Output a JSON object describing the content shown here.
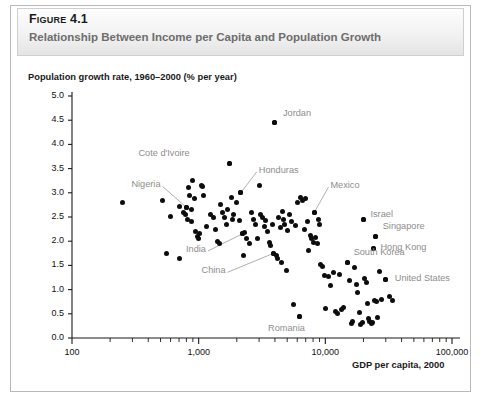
{
  "figure": {
    "number_label": "Figure 4.1",
    "subtitle": "Relationship Between Income per Capita and Population Growth",
    "accent_color": "#4c4c4c",
    "label_color": "#8d8d8d",
    "point_color": "#0d0d0d"
  },
  "chart_data": {
    "type": "scatter",
    "title": "Relationship Between Income per Capita and Population Growth",
    "xlabel": "GDP per capita, 2000",
    "ylabel": "Population growth rate, 1960–2000 (% per year)",
    "x_scale": "log",
    "y_scale": "linear",
    "xlim": [
      100,
      100000
    ],
    "ylim": [
      0.0,
      5.0
    ],
    "grid": false,
    "legend": null,
    "x_tick_labels": [
      "100",
      "1,000",
      "10,000",
      "100,000"
    ],
    "x_tick_values": [
      100,
      1000,
      10000,
      100000
    ],
    "y_tick_labels": [
      "0.0",
      "0.5",
      "1.0",
      "1.5",
      "2.0",
      "2.5",
      "3.0",
      "3.5",
      "4.0",
      "4.5",
      "5.0"
    ],
    "y_tick_values": [
      0.0,
      0.5,
      1.0,
      1.5,
      2.0,
      2.5,
      3.0,
      3.5,
      4.0,
      4.5,
      5.0
    ],
    "minor_ticks": "log decades 2-9",
    "annotations": [
      {
        "label": "Jordan",
        "x": 4000,
        "y": 4.45,
        "label_dx": 8,
        "label_dy": -9,
        "leader": false
      },
      {
        "label": "Cote d'Ivoire",
        "x": 1750,
        "y": 3.6,
        "label_dx": -52,
        "label_dy": -10,
        "leader": false
      },
      {
        "label": "Honduras",
        "x": 2150,
        "y": 3.0,
        "label_dx": 18,
        "label_dy": -22,
        "leader": true
      },
      {
        "label": "Nigeria",
        "x": 800,
        "y": 2.7,
        "label_dx": -38,
        "label_dy": -22,
        "leader": true
      },
      {
        "label": "Mexico",
        "x": 8200,
        "y": 2.6,
        "label_dx": 16,
        "label_dy": -26,
        "leader": true
      },
      {
        "label": "Israel",
        "x": 20000,
        "y": 2.45,
        "label_dx": 7,
        "label_dy": -4,
        "leader": false
      },
      {
        "label": "Singapore",
        "x": 25000,
        "y": 2.1,
        "label_dx": 7,
        "label_dy": -9,
        "leader": false
      },
      {
        "label": "Hong Kong",
        "x": 24000,
        "y": 1.85,
        "label_dx": 7,
        "label_dy": 0,
        "leader": false
      },
      {
        "label": "South Korea",
        "x": 15000,
        "y": 1.55,
        "label_dx": 6,
        "label_dy": -10,
        "leader": false
      },
      {
        "label": "United States",
        "x": 30000,
        "y": 1.2,
        "label_dx": 9,
        "label_dy": -1,
        "leader": false
      },
      {
        "label": "India",
        "x": 2200,
        "y": 2.15,
        "label_dx": -48,
        "label_dy": 16,
        "leader": true
      },
      {
        "label": "China",
        "x": 3900,
        "y": 1.75,
        "label_dx": -60,
        "label_dy": 18,
        "leader": true
      },
      {
        "label": "Romania",
        "x": 6200,
        "y": 0.45,
        "label_dx": -6,
        "label_dy": 13,
        "leader": false
      }
    ],
    "points": [
      {
        "x": 250,
        "y": 2.8
      },
      {
        "x": 520,
        "y": 2.85
      },
      {
        "x": 600,
        "y": 2.52
      },
      {
        "x": 700,
        "y": 2.72
      },
      {
        "x": 760,
        "y": 2.6
      },
      {
        "x": 790,
        "y": 2.55
      },
      {
        "x": 800,
        "y": 2.7
      },
      {
        "x": 810,
        "y": 2.45
      },
      {
        "x": 830,
        "y": 3.1
      },
      {
        "x": 850,
        "y": 2.95
      },
      {
        "x": 870,
        "y": 2.65
      },
      {
        "x": 880,
        "y": 2.4
      },
      {
        "x": 900,
        "y": 3.25
      },
      {
        "x": 920,
        "y": 2.88
      },
      {
        "x": 950,
        "y": 2.2
      },
      {
        "x": 980,
        "y": 2.1
      },
      {
        "x": 1000,
        "y": 2.05
      },
      {
        "x": 1020,
        "y": 2.15
      },
      {
        "x": 1050,
        "y": 3.15
      },
      {
        "x": 1080,
        "y": 3.12
      },
      {
        "x": 1100,
        "y": 2.95
      },
      {
        "x": 1150,
        "y": 2.3
      },
      {
        "x": 560,
        "y": 1.75
      },
      {
        "x": 700,
        "y": 1.65
      },
      {
        "x": 1250,
        "y": 2.55
      },
      {
        "x": 1300,
        "y": 2.48
      },
      {
        "x": 1350,
        "y": 2.25
      },
      {
        "x": 1400,
        "y": 2.0
      },
      {
        "x": 1450,
        "y": 1.95
      },
      {
        "x": 1500,
        "y": 2.75
      },
      {
        "x": 1550,
        "y": 2.6
      },
      {
        "x": 1600,
        "y": 2.5
      },
      {
        "x": 1650,
        "y": 2.35
      },
      {
        "x": 1700,
        "y": 2.65
      },
      {
        "x": 1750,
        "y": 3.6
      },
      {
        "x": 1800,
        "y": 2.9
      },
      {
        "x": 1850,
        "y": 2.45
      },
      {
        "x": 1900,
        "y": 2.55
      },
      {
        "x": 2000,
        "y": 2.8
      },
      {
        "x": 2100,
        "y": 2.42
      },
      {
        "x": 2150,
        "y": 3.0
      },
      {
        "x": 2200,
        "y": 2.15
      },
      {
        "x": 2250,
        "y": 1.7
      },
      {
        "x": 2300,
        "y": 2.18
      },
      {
        "x": 2400,
        "y": 2.05
      },
      {
        "x": 2500,
        "y": 1.95
      },
      {
        "x": 2600,
        "y": 2.6
      },
      {
        "x": 2700,
        "y": 2.45
      },
      {
        "x": 2800,
        "y": 2.35
      },
      {
        "x": 2900,
        "y": 2.05
      },
      {
        "x": 3000,
        "y": 3.15
      },
      {
        "x": 3100,
        "y": 2.55
      },
      {
        "x": 3200,
        "y": 2.48
      },
      {
        "x": 3300,
        "y": 2.3
      },
      {
        "x": 3400,
        "y": 2.42
      },
      {
        "x": 3500,
        "y": 2.2
      },
      {
        "x": 3600,
        "y": 1.98
      },
      {
        "x": 3700,
        "y": 1.92
      },
      {
        "x": 3800,
        "y": 2.35
      },
      {
        "x": 3900,
        "y": 1.75
      },
      {
        "x": 4000,
        "y": 4.45
      },
      {
        "x": 4100,
        "y": 1.7
      },
      {
        "x": 4200,
        "y": 1.65
      },
      {
        "x": 4300,
        "y": 2.5
      },
      {
        "x": 4400,
        "y": 2.28
      },
      {
        "x": 4500,
        "y": 1.55
      },
      {
        "x": 4600,
        "y": 2.62
      },
      {
        "x": 4700,
        "y": 2.45
      },
      {
        "x": 4800,
        "y": 2.35
      },
      {
        "x": 4900,
        "y": 1.4
      },
      {
        "x": 5000,
        "y": 2.22
      },
      {
        "x": 5200,
        "y": 2.55
      },
      {
        "x": 5400,
        "y": 2.4
      },
      {
        "x": 5600,
        "y": 0.7
      },
      {
        "x": 5800,
        "y": 2.32
      },
      {
        "x": 6000,
        "y": 2.8
      },
      {
        "x": 6200,
        "y": 0.45
      },
      {
        "x": 6400,
        "y": 2.9
      },
      {
        "x": 6600,
        "y": 2.85
      },
      {
        "x": 6800,
        "y": 2.25
      },
      {
        "x": 7000,
        "y": 2.88
      },
      {
        "x": 7200,
        "y": 2.4
      },
      {
        "x": 7400,
        "y": 1.8
      },
      {
        "x": 7600,
        "y": 2.12
      },
      {
        "x": 7800,
        "y": 2.05
      },
      {
        "x": 8000,
        "y": 1.98
      },
      {
        "x": 8200,
        "y": 2.6
      },
      {
        "x": 8400,
        "y": 2.08
      },
      {
        "x": 8600,
        "y": 1.95
      },
      {
        "x": 8800,
        "y": 2.45
      },
      {
        "x": 9000,
        "y": 2.35
      },
      {
        "x": 9200,
        "y": 1.52
      },
      {
        "x": 9500,
        "y": 1.48
      },
      {
        "x": 9800,
        "y": 1.3
      },
      {
        "x": 10000,
        "y": 0.6
      },
      {
        "x": 10500,
        "y": 1.28
      },
      {
        "x": 11000,
        "y": 1.08
      },
      {
        "x": 11500,
        "y": 1.35
      },
      {
        "x": 12000,
        "y": 0.55
      },
      {
        "x": 12500,
        "y": 0.5
      },
      {
        "x": 13000,
        "y": 1.32
      },
      {
        "x": 13500,
        "y": 0.58
      },
      {
        "x": 14000,
        "y": 0.62
      },
      {
        "x": 15000,
        "y": 1.55
      },
      {
        "x": 15500,
        "y": 1.18
      },
      {
        "x": 16000,
        "y": 0.3
      },
      {
        "x": 16500,
        "y": 0.35
      },
      {
        "x": 17000,
        "y": 1.45
      },
      {
        "x": 17500,
        "y": 1.1
      },
      {
        "x": 18000,
        "y": 0.95
      },
      {
        "x": 18500,
        "y": 0.52
      },
      {
        "x": 19000,
        "y": 0.28
      },
      {
        "x": 19500,
        "y": 0.32
      },
      {
        "x": 20000,
        "y": 2.45
      },
      {
        "x": 20500,
        "y": 1.22
      },
      {
        "x": 21000,
        "y": 1.15
      },
      {
        "x": 21500,
        "y": 0.72
      },
      {
        "x": 22000,
        "y": 0.4
      },
      {
        "x": 22500,
        "y": 0.35
      },
      {
        "x": 23000,
        "y": 0.3
      },
      {
        "x": 23500,
        "y": 0.33
      },
      {
        "x": 24000,
        "y": 1.85
      },
      {
        "x": 24500,
        "y": 0.78
      },
      {
        "x": 25000,
        "y": 2.1
      },
      {
        "x": 25500,
        "y": 0.75
      },
      {
        "x": 26000,
        "y": 0.42
      },
      {
        "x": 27000,
        "y": 1.38
      },
      {
        "x": 28000,
        "y": 0.8
      },
      {
        "x": 30000,
        "y": 1.2
      },
      {
        "x": 32000,
        "y": 0.85
      },
      {
        "x": 34000,
        "y": 0.78
      }
    ]
  }
}
